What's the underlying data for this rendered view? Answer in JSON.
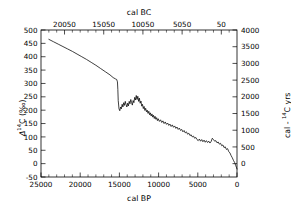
{
  "figure": {
    "width": 291,
    "height": 214,
    "background": "#ffffff",
    "foreground": "#000000"
  },
  "plot_box": {
    "left": 41,
    "right": 237,
    "top": 30,
    "bottom": 177
  },
  "axes": {
    "bottom": {
      "title": "cal BP",
      "ticks": [
        "25000",
        "20000",
        "15000",
        "10000",
        "5000",
        "0"
      ],
      "tick_values": [
        25000,
        20000,
        15000,
        10000,
        5000,
        0
      ],
      "range": [
        25000,
        0
      ],
      "minor_per_interval": 5,
      "reversed": true
    },
    "top": {
      "title": "cal BC",
      "ticks": [
        "20050",
        "15050",
        "10050",
        "5050",
        "50"
      ],
      "tick_values": [
        22000,
        17000,
        12000,
        7000,
        2000
      ],
      "range": [
        25000,
        0
      ],
      "minor_per_interval": 5,
      "reversed": true
    },
    "left": {
      "title_parts": {
        "delta": "Δ",
        "sup": "14",
        "element": "C (‰)"
      },
      "title": "Δ14C (‰)",
      "ticks": [
        "500",
        "450",
        "400",
        "350",
        "300",
        "250",
        "200",
        "150",
        "100",
        "50",
        "0",
        "-50"
      ],
      "tick_values": [
        500,
        450,
        400,
        350,
        300,
        250,
        200,
        150,
        100,
        50,
        0,
        -50
      ],
      "range": [
        -50,
        500
      ]
    },
    "right": {
      "title_parts": {
        "pre": "cal - ",
        "sup": "14",
        "post": "C yrs"
      },
      "title": "cal - 14C yrs",
      "ticks": [
        "4000",
        "3500",
        "3000",
        "2500",
        "2000",
        "1500",
        "1000",
        "500",
        "0"
      ],
      "tick_values": [
        4000,
        3500,
        3000,
        2500,
        2000,
        1500,
        1000,
        500,
        0
      ],
      "range": [
        -400,
        4000
      ]
    }
  },
  "chart_data": {
    "type": "line",
    "title": "",
    "xlabel": "cal BP",
    "ylabel": "Δ14C (‰)",
    "xlim": [
      25000,
      0
    ],
    "ylim": [
      -50,
      500
    ],
    "grid": false,
    "legend": null,
    "series": [
      {
        "name": "Δ14C",
        "color": "#000000",
        "x": [
          24000,
          23400,
          22800,
          22200,
          21600,
          21000,
          20400,
          19800,
          19200,
          18600,
          18000,
          17400,
          16800,
          16200,
          15800,
          15500,
          15350,
          15250,
          15200,
          15150,
          15050,
          14950,
          14850,
          14750,
          14650,
          14550,
          14450,
          14350,
          14250,
          14150,
          14050,
          13950,
          13850,
          13750,
          13650,
          13550,
          13450,
          13350,
          13250,
          13150,
          13050,
          12950,
          12850,
          12750,
          12650,
          12550,
          12450,
          12350,
          12250,
          12150,
          12050,
          11950,
          11850,
          11750,
          11650,
          11550,
          11450,
          11350,
          11250,
          11150,
          11050,
          10950,
          10850,
          10750,
          10650,
          10550,
          10450,
          10350,
          10250,
          10150,
          10050,
          9900,
          9750,
          9600,
          9450,
          9300,
          9150,
          9000,
          8850,
          8700,
          8550,
          8400,
          8250,
          8100,
          7950,
          7800,
          7650,
          7500,
          7350,
          7200,
          7050,
          6900,
          6750,
          6600,
          6450,
          6300,
          6150,
          6000,
          5850,
          5700,
          5550,
          5400,
          5250,
          5100,
          4950,
          4800,
          4650,
          4500,
          4350,
          4200,
          4050,
          3900,
          3750,
          3600,
          3450,
          3300,
          3150,
          3000,
          2850,
          2700,
          2550,
          2400,
          2250,
          2100,
          1950,
          1800,
          1650,
          1500,
          1350,
          1200,
          1050,
          900,
          750,
          600,
          450,
          300,
          150,
          50,
          0
        ],
        "y": [
          465,
          456,
          447,
          438,
          429,
          420,
          410,
          400,
          390,
          379,
          368,
          356,
          344,
          332,
          322,
          317,
          315,
          306,
          278,
          236,
          205,
          198,
          212,
          205,
          222,
          212,
          228,
          218,
          233,
          221,
          212,
          226,
          216,
          233,
          224,
          240,
          229,
          219,
          236,
          228,
          248,
          238,
          255,
          240,
          252,
          233,
          245,
          226,
          234,
          215,
          222,
          206,
          214,
          199,
          207,
          194,
          200,
          188,
          196,
          183,
          190,
          178,
          186,
          174,
          181,
          169,
          177,
          166,
          172,
          161,
          168,
          158,
          164,
          154,
          160,
          150,
          156,
          147,
          152,
          143,
          148,
          139,
          145,
          136,
          141,
          132,
          137,
          128,
          133,
          124,
          128,
          119,
          124,
          115,
          119,
          110,
          114,
          105,
          108,
          100,
          103,
          95,
          98,
          90,
          86,
          92,
          84,
          90,
          82,
          88,
          80,
          86,
          79,
          84,
          77,
          83,
          95,
          90,
          84,
          86,
          78,
          81,
          73,
          76,
          67,
          70,
          60,
          63,
          53,
          56,
          45,
          40,
          30,
          22,
          12,
          4,
          -8,
          -16,
          -20
        ],
        "style": "solid",
        "width": 0.75
      }
    ],
    "notes": [
      "Δ14C declines approximately linearly from ~465‰ at 24000 cal BP to ~315‰ at 15300 cal BP",
      "Abrupt drop near 15200 cal BP from ~315‰ to ~200‰",
      "Noisy plateau 15000-12000 cal BP oscillating between ~195‰ and ~255‰",
      "General decline through the Holocene with a secondary bump near 7000 cal BP (~95‰)",
      "Minimum of about -20‰ near 500-1000 cal BP, rising slightly to present"
    ]
  }
}
